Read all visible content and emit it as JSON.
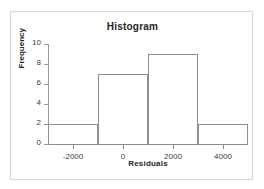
{
  "chart_data": {
    "type": "bar",
    "title": "Histogram",
    "xlabel": "Residuals",
    "ylabel": "Frequency",
    "categories": [
      "-3000 to -1000",
      "-1000 to 1000",
      "1000 to 3000",
      "3000 to 5000"
    ],
    "bin_edges": [
      -3000,
      -1000,
      1000,
      3000,
      5000
    ],
    "values": [
      2,
      7,
      9,
      2
    ],
    "xlim": [
      -3000,
      5000
    ],
    "ylim": [
      0,
      10
    ],
    "x_ticks": [
      -2000,
      0,
      2000,
      4000
    ],
    "x_tick_labels": [
      "-2000",
      "0",
      "2000",
      "4000"
    ],
    "y_ticks": [
      0,
      2,
      4,
      6,
      8,
      10
    ],
    "y_tick_labels": [
      "0",
      "2",
      "4",
      "6",
      "8",
      "10"
    ],
    "grid": false,
    "legend": null,
    "bar_fill": "none",
    "bar_outline_color": "#8f8f8f",
    "axis_color": "#8a8a8a",
    "frame_color": "#d6d6d6",
    "text_color": "#262626",
    "background": "#ffffff"
  }
}
